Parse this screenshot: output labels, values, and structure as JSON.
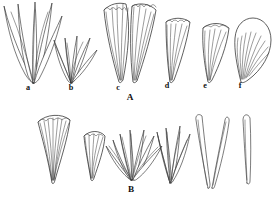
{
  "figure": {
    "background_color": "#ffffff",
    "ink_color": "#222222",
    "rows": [
      {
        "group_label": "A",
        "group_label_x": 130,
        "group_label_y": 100,
        "specimens": [
          {
            "label": "a",
            "label_x": 28,
            "label_y": 90,
            "form": "narrow-lanceolate-cluster",
            "blade_count": 6
          },
          {
            "label": "b",
            "label_x": 71,
            "label_y": 90,
            "form": "spreading-linear-cluster",
            "blade_count": 6
          },
          {
            "label": "c",
            "label_x": 118,
            "label_y": 90,
            "form": "broad-fan-cuneate",
            "blade_count": 14
          },
          {
            "label": "d",
            "label_x": 167,
            "label_y": 88,
            "form": "narrow-fan-cuneate",
            "blade_count": 9
          },
          {
            "label": "e",
            "label_x": 205,
            "label_y": 88,
            "form": "obtriangular-fan",
            "blade_count": 9
          },
          {
            "label": "f",
            "label_x": 240,
            "label_y": 88,
            "form": "dense-ovate-fan",
            "blade_count": 20
          }
        ]
      },
      {
        "group_label": "B",
        "group_label_x": 131,
        "group_label_y": 192,
        "specimens": [
          {
            "label": "",
            "form": "broad-dense-fan",
            "blade_count": 16
          },
          {
            "label": "",
            "form": "short-fan",
            "blade_count": 9
          },
          {
            "label": "",
            "form": "spreading-falcate-cluster",
            "blade_count": 14
          },
          {
            "label": "",
            "form": "erect-linear-cluster",
            "blade_count": 9
          },
          {
            "label": "",
            "form": "paired-elongate-blades",
            "blade_count": 3
          },
          {
            "label": "",
            "form": "single-linear-blade",
            "blade_count": 1
          }
        ]
      }
    ]
  }
}
